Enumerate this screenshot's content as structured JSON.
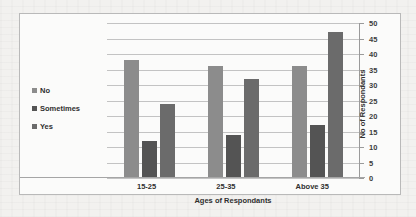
{
  "chart_data": {
    "type": "bar",
    "title": "",
    "xlabel": "Ages of Respondants",
    "ylabel": "No of Respondants",
    "categories": [
      "15-25",
      "25-35",
      "Above 35"
    ],
    "series": [
      {
        "name": "No",
        "values": [
          38,
          36,
          36
        ],
        "color": "#8c8c8c"
      },
      {
        "name": "Sometimes",
        "values": [
          12,
          14,
          17
        ],
        "color": "#545454"
      },
      {
        "name": "Yes",
        "values": [
          24,
          32,
          47
        ],
        "color": "#6b6b6b"
      }
    ],
    "ylim": [
      0,
      50
    ],
    "yticks": [
      0,
      5,
      10,
      15,
      20,
      25,
      30,
      35,
      40,
      45,
      50
    ],
    "grid": true,
    "legend_position": "left",
    "axis_position": "right"
  },
  "legend": {
    "items": [
      {
        "label": "No"
      },
      {
        "label": "Sometimes"
      },
      {
        "label": "Yes"
      }
    ]
  },
  "axes": {
    "y_title": "No of Respondants",
    "x_title": "Ages of Respondants",
    "tick_labels": [
      "50",
      "45",
      "40",
      "35",
      "30",
      "25",
      "20",
      "15",
      "10",
      "5",
      "0"
    ]
  },
  "x_labels": [
    "15-25",
    "25-35",
    "Above 35"
  ]
}
